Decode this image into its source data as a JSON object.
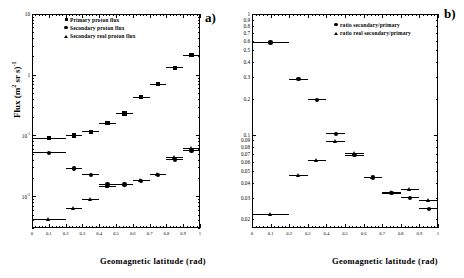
{
  "figure": {
    "panels": [
      {
        "tag": "a)",
        "xlabel": "Geomagnetic  latitude (rad)",
        "ylabel": "Flux (m  sr s)"
      },
      {
        "tag": "b)",
        "xlabel": "Geomagnetic  latitude (rad)",
        "ylabel": ""
      }
    ]
  },
  "chart_data": [
    {
      "type": "scatter",
      "panel": "a",
      "title": "",
      "xlabel": "Geomagnetic  latitude (rad)",
      "ylabel": "Flux (m^2 sr s)^-1",
      "yscale": "log",
      "xscale": "linear",
      "xlim": [
        0,
        1
      ],
      "ylim": [
        0.003,
        10
      ],
      "grid": false,
      "legend_position": "top-left",
      "xticks": [
        0,
        0.1,
        0.2,
        0.3,
        0.4,
        0.5,
        0.6,
        0.7,
        0.8,
        0.9,
        1
      ],
      "xticklabels": [
        "0",
        "0.1",
        "0.2",
        "0.3",
        "0.4",
        "0.5",
        "0.6",
        "0.7",
        "0.8",
        "0.9",
        "1"
      ],
      "yticks": [
        10,
        1,
        0.1,
        0.01
      ],
      "yticklabels": [
        "10",
        "1",
        "10-1",
        "10-2"
      ],
      "series": [
        {
          "name": "Primary proton flux",
          "marker": "square",
          "x": [
            0.1,
            0.25,
            0.35,
            0.45,
            0.55,
            0.65,
            0.75,
            0.85,
            0.95
          ],
          "y": [
            0.09,
            0.1,
            0.115,
            0.16,
            0.23,
            0.43,
            0.7,
            1.3,
            2.1
          ],
          "xerr": [
            0.1,
            0.05,
            0.05,
            0.05,
            0.05,
            0.05,
            0.05,
            0.05,
            0.05
          ]
        },
        {
          "name": "Secondary proton flux",
          "marker": "circle",
          "x": [
            0.1,
            0.25,
            0.35,
            0.45,
            0.55,
            0.65,
            0.75,
            0.85,
            0.95
          ],
          "y": [
            0.052,
            0.0285,
            0.0225,
            0.0155,
            0.0155,
            0.018,
            0.0225,
            0.04,
            0.0565
          ],
          "xerr": [
            0.1,
            0.05,
            0.05,
            0.05,
            0.05,
            0.05,
            0.05,
            0.05,
            0.05
          ]
        },
        {
          "name": "Secondary real proton flux",
          "marker": "triangle",
          "x": [
            0.1,
            0.25,
            0.35,
            0.45,
            0.55,
            0.65,
            0.75,
            0.85,
            0.95
          ],
          "y": [
            0.0042,
            0.0062,
            0.009,
            0.0145,
            0.0158,
            0.0185,
            0.0232,
            0.044,
            0.062
          ],
          "xerr": [
            0.1,
            0.05,
            0.05,
            0.05,
            0.05,
            0.05,
            0.05,
            0.05,
            0.05
          ]
        }
      ]
    },
    {
      "type": "scatter",
      "panel": "b",
      "title": "",
      "xlabel": "Geomagnetic  latitude (rad)",
      "ylabel": "",
      "yscale": "log",
      "xscale": "linear",
      "xlim": [
        0,
        1
      ],
      "ylim": [
        0.017,
        1.0
      ],
      "grid": false,
      "legend_position": "top-right",
      "xticks": [
        0,
        0.1,
        0.2,
        0.3,
        0.4,
        0.5,
        0.6,
        0.7,
        0.8,
        0.9,
        1
      ],
      "xticklabels": [
        "0",
        "0.1",
        "0.2",
        "0.3",
        "0.4",
        "0.5",
        "0.6",
        "0.7",
        "0.8",
        "0.9",
        "1"
      ],
      "yticks": [
        1,
        0.9,
        0.8,
        0.7,
        0.6,
        0.5,
        0.4,
        0.3,
        0.2,
        0.1,
        0.09,
        0.08,
        0.07,
        0.06,
        0.05,
        0.04,
        0.03,
        0.02
      ],
      "yticklabels": [
        "1",
        "0.9",
        "0.8",
        "0.7",
        "0.6",
        "0.5",
        "0.4",
        "0.3",
        "0.2",
        "0.1",
        "0.09",
        "0.08",
        "0.07",
        "0.06",
        "0.05",
        "0.04",
        "0.03",
        "0.02"
      ],
      "series": [
        {
          "name": "ratio secondary/primary",
          "marker": "circle",
          "x": [
            0.1,
            0.25,
            0.35,
            0.45,
            0.55,
            0.65,
            0.75,
            0.85,
            0.95
          ],
          "y": [
            0.58,
            0.29,
            0.195,
            0.102,
            0.068,
            0.0445,
            0.033,
            0.0302,
            0.0245
          ],
          "xerr": [
            0.1,
            0.05,
            0.05,
            0.05,
            0.05,
            0.05,
            0.05,
            0.05,
            0.05
          ]
        },
        {
          "name": "ratio real secondary/primary",
          "marker": "triangle",
          "x": [
            0.1,
            0.25,
            0.35,
            0.45,
            0.55,
            0.65,
            0.75,
            0.85,
            0.95
          ],
          "y": [
            0.022,
            0.0465,
            0.062,
            0.088,
            0.07,
            0.0445,
            0.0335,
            0.0355,
            0.0288
          ],
          "xerr": [
            0.1,
            0.05,
            0.05,
            0.05,
            0.05,
            0.05,
            0.05,
            0.05,
            0.05
          ]
        }
      ]
    }
  ],
  "legends": {
    "panel_a": [
      {
        "label": "Primary proton flux",
        "marker": "square"
      },
      {
        "label": "Secondary proton flux",
        "marker": "circle"
      },
      {
        "label": "Secondary real proton flux",
        "marker": "triangle"
      }
    ],
    "panel_b": [
      {
        "label": "ratio secondary/primary",
        "marker": "circle"
      },
      {
        "label": "ratio real secondary/primary",
        "marker": "triangle"
      }
    ]
  },
  "colors": {
    "ink": "#000000",
    "background": "#ffffff"
  }
}
